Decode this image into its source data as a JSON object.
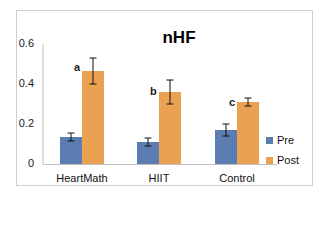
{
  "chart_data": {
    "type": "bar",
    "title": "nHF",
    "xlabel": "",
    "ylabel": "",
    "categories": [
      "HeartMath",
      "HIIT",
      "Control"
    ],
    "series": [
      {
        "name": "Pre",
        "color": "#5b7db1",
        "values": [
          0.135,
          0.11,
          0.17
        ],
        "errors": [
          0.02,
          0.02,
          0.03
        ]
      },
      {
        "name": "Post",
        "color": "#eba152",
        "values": [
          0.465,
          0.36,
          0.31
        ],
        "errors": [
          0.065,
          0.06,
          0.02
        ]
      }
    ],
    "significance_labels": [
      "a",
      "b",
      "c"
    ],
    "ylim": [
      0,
      0.6
    ],
    "yticks": [
      "0",
      "0.2",
      "0.4",
      "0.6"
    ],
    "grid": false,
    "legend_position": "right"
  },
  "title": "nHF",
  "yticks": {
    "t0": "0",
    "t1": "0.2",
    "t2": "0.4",
    "t3": "0.6"
  },
  "categories": {
    "c0": "HeartMath",
    "c1": "HIIT",
    "c2": "Control"
  },
  "sig": {
    "s0": "a",
    "s1": "b",
    "s2": "c"
  },
  "legend": {
    "pre": "Pre",
    "post": "Post"
  },
  "colors": {
    "pre": "#5b7db1",
    "post": "#eba152",
    "axis": "#bfbfbf",
    "frame": "#cfcfcf"
  }
}
